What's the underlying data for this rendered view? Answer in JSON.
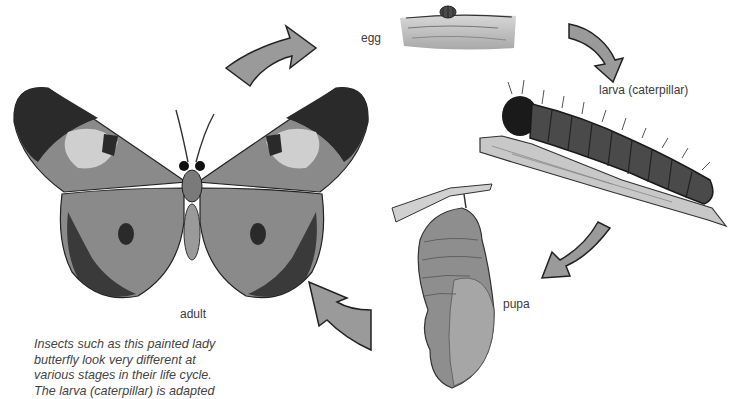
{
  "figure": {
    "stages": [
      {
        "id": "egg",
        "label": "egg"
      },
      {
        "id": "larva",
        "label": "larva (caterpillar)"
      },
      {
        "id": "pupa",
        "label": "pupa"
      },
      {
        "id": "adult",
        "label": "adult"
      }
    ],
    "cycle_order": [
      "egg",
      "larva",
      "pupa",
      "adult"
    ],
    "arrows": [
      {
        "from": "adult",
        "to": "egg"
      },
      {
        "from": "egg",
        "to": "larva"
      },
      {
        "from": "larva",
        "to": "pupa"
      },
      {
        "from": "pupa",
        "to": "adult"
      }
    ],
    "colors": {
      "arrow_fill": "#9a9a9a",
      "arrow_stroke": "#222222",
      "label_text": "#3a3a3a",
      "caption_text": "#444444"
    }
  },
  "caption": {
    "lines": [
      "Insects such as this painted lady",
      "butterfly look very different at",
      "various stages in their life cycle.",
      "The larva (caterpillar) is adapted"
    ]
  }
}
